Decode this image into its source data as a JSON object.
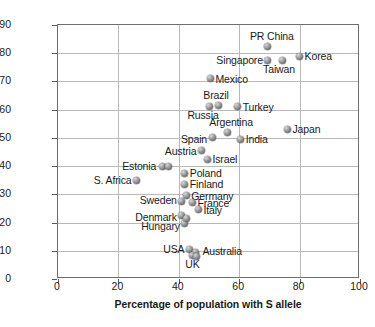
{
  "chart_data": {
    "type": "scatter",
    "title": "",
    "xlabel": "Percentage of population with S allele",
    "ylabel": "Individualism–collectivism",
    "xlim": [
      0,
      100
    ],
    "ylim": [
      0,
      90
    ],
    "xticks": [
      "0",
      "20",
      "40",
      "60",
      "80",
      "100"
    ],
    "yticks": [
      "0",
      "10",
      "20",
      "30",
      "40",
      "50",
      "60",
      "70",
      "80",
      "90"
    ],
    "xtick_values": [
      0,
      20,
      40,
      60,
      80,
      100
    ],
    "ytick_values": [
      0,
      10,
      20,
      30,
      40,
      50,
      60,
      70,
      80,
      90
    ],
    "grid": "horizontal-and-vertical",
    "legend": "none",
    "marker_style": "gray-sphere",
    "points": [
      {
        "label": "PR China",
        "x": 69.5,
        "y": 82.5,
        "lpos": "t",
        "ldx": 4,
        "ldy": -4
      },
      {
        "label": "Singapore",
        "x": 69.5,
        "y": 77.5,
        "lpos": "l",
        "ldx": -5,
        "ldy": 0
      },
      {
        "label": "Taiwan",
        "x": 74.5,
        "y": 77.5,
        "lpos": "b",
        "ldx": -4,
        "ldy": 4
      },
      {
        "label": "Korea",
        "x": 80.0,
        "y": 79.0,
        "lpos": "r",
        "ldx": 5,
        "ldy": 0
      },
      {
        "label": "Mexico",
        "x": 50.5,
        "y": 71.0,
        "lpos": "r",
        "ldx": 5,
        "ldy": 0
      },
      {
        "label": "Brazil",
        "x": 53.0,
        "y": 61.5,
        "lpos": "t",
        "ldx": -2,
        "ldy": -4
      },
      {
        "label": "Russia",
        "x": 50.0,
        "y": 61.0,
        "lpos": "b",
        "ldx": -6,
        "ldy": 3
      },
      {
        "label": "Turkey",
        "x": 59.5,
        "y": 61.0,
        "lpos": "r",
        "ldx": 5,
        "ldy": 0
      },
      {
        "label": "Argentina",
        "x": 56.0,
        "y": 52.0,
        "lpos": "t",
        "ldx": 4,
        "ldy": -4
      },
      {
        "label": "Spain",
        "x": 51.0,
        "y": 50.0,
        "lpos": "l",
        "ldx": -5,
        "ldy": 1
      },
      {
        "label": "India",
        "x": 60.5,
        "y": 49.5,
        "lpos": "r",
        "ldx": 5,
        "ldy": 0
      },
      {
        "label": "Japan",
        "x": 76.0,
        "y": 53.0,
        "lpos": "r",
        "ldx": 5,
        "ldy": 0
      },
      {
        "label": "Austria",
        "x": 47.5,
        "y": 45.5,
        "lpos": "l",
        "ldx": -5,
        "ldy": 0
      },
      {
        "label": "Israel",
        "x": 49.5,
        "y": 42.5,
        "lpos": "r",
        "ldx": 5,
        "ldy": 0
      },
      {
        "label": "Estonia",
        "x": 34.5,
        "y": 40.0,
        "lpos": "l",
        "ldx": -6,
        "ldy": 0
      },
      {
        "label": "",
        "x": 36.5,
        "y": 40.0,
        "lpos": "r",
        "ldx": 0,
        "ldy": 0
      },
      {
        "label": "S. Africa",
        "x": 26.0,
        "y": 35.0,
        "lpos": "l",
        "ldx": -5,
        "ldy": 0
      },
      {
        "label": "Poland",
        "x": 42.0,
        "y": 37.5,
        "lpos": "r",
        "ldx": 5,
        "ldy": 0
      },
      {
        "label": "Finland",
        "x": 42.0,
        "y": 33.5,
        "lpos": "r",
        "ldx": 5,
        "ldy": 0
      },
      {
        "label": "Germany",
        "x": 42.5,
        "y": 29.5,
        "lpos": "r",
        "ldx": 5,
        "ldy": 0
      },
      {
        "label": "France",
        "x": 44.5,
        "y": 27.0,
        "lpos": "r",
        "ldx": 5,
        "ldy": 0
      },
      {
        "label": "Italy",
        "x": 46.5,
        "y": 24.5,
        "lpos": "r",
        "ldx": 5,
        "ldy": 0
      },
      {
        "label": "Sweden",
        "x": 41.0,
        "y": 27.5,
        "lpos": "l",
        "ldx": -5,
        "ldy": -1
      },
      {
        "label": "Denmark",
        "x": 41.0,
        "y": 22.5,
        "lpos": "l",
        "ldx": -5,
        "ldy": 1
      },
      {
        "label": "Hungary",
        "x": 42.0,
        "y": 19.5,
        "lpos": "l",
        "ldx": -5,
        "ldy": 2
      },
      {
        "label": "",
        "x": 42.5,
        "y": 21.5,
        "lpos": "r",
        "ldx": 0,
        "ldy": 0
      },
      {
        "label": "USA",
        "x": 43.5,
        "y": 10.5,
        "lpos": "l",
        "ldx": -5,
        "ldy": 0
      },
      {
        "label": "Australia",
        "x": 45.5,
        "y": 9.5,
        "lpos": "r",
        "ldx": 7,
        "ldy": -1
      },
      {
        "label": "UK",
        "x": 44.5,
        "y": 8.5,
        "lpos": "b",
        "ldx": 0,
        "ldy": 4
      },
      {
        "label": "",
        "x": 46.0,
        "y": 8.0,
        "lpos": "r",
        "ldx": 0,
        "ldy": 0
      }
    ]
  },
  "colors": {
    "frame": "#6e6e6e",
    "grid": "#b9b9b9",
    "marker": "#7a7a7a",
    "text": "#1a1a1a",
    "background": "#ffffff"
  }
}
